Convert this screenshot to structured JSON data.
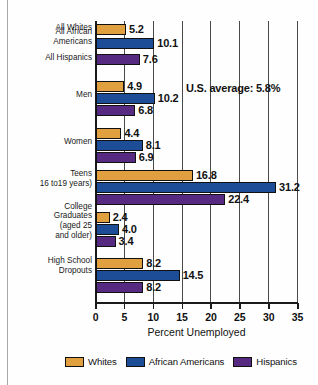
{
  "chart_data": {
    "type": "bar",
    "orientation": "horizontal",
    "title": "",
    "xlabel": "Percent Unemployed",
    "ylabel": "",
    "xlim": [
      0,
      35
    ],
    "xticks": [
      0,
      5,
      10,
      15,
      20,
      25,
      30,
      35
    ],
    "grid": true,
    "legend_position": "bottom",
    "categories": [
      "All Whites",
      "All African\nAmericans",
      "All Hispanics",
      "Men",
      "Women",
      "Teens\n16 to19 years)",
      "College\nGraduates\n(aged 25\nand older)",
      "High School\nDropouts"
    ],
    "series": [
      {
        "name": "Whites",
        "color": "#e0a03f"
      },
      {
        "name": "African Americans",
        "color": "#1c4d96"
      },
      {
        "name": "Hispanics",
        "color": "#552a80"
      }
    ],
    "groups": [
      {
        "label_lines": [
          "All Whites"
        ],
        "label_anchor_y": 27,
        "single": true,
        "bars": [
          {
            "series": "Whites",
            "value": 5.2,
            "label": "5.2",
            "y": 24
          }
        ]
      },
      {
        "label_lines": [
          "All African",
          "Americans"
        ],
        "label_anchor_y": 36,
        "single": true,
        "bars": [
          {
            "series": "African Americans",
            "value": 10.1,
            "label": "10.1",
            "y": 38
          }
        ]
      },
      {
        "label_lines": [
          "All Hispanics"
        ],
        "label_anchor_y": 57,
        "single": true,
        "bars": [
          {
            "series": "Hispanics",
            "value": 7.6,
            "label": "7.6",
            "y": 54
          }
        ]
      },
      {
        "label_lines": [
          "Men"
        ],
        "label_anchor_y": 94,
        "single": false,
        "bars": [
          {
            "series": "Whites",
            "value": 4.9,
            "label": "4.9",
            "y": 81
          },
          {
            "series": "African Americans",
            "value": 10.2,
            "label": "10.2",
            "y": 93
          },
          {
            "series": "Hispanics",
            "value": 6.8,
            "label": "6.8",
            "y": 105
          }
        ]
      },
      {
        "label_lines": [
          "Women"
        ],
        "label_anchor_y": 141,
        "single": false,
        "bars": [
          {
            "series": "Whites",
            "value": 4.4,
            "label": "4.4",
            "y": 128
          },
          {
            "series": "African Americans",
            "value": 8.1,
            "label": "8.1",
            "y": 140
          },
          {
            "series": "Hispanics",
            "value": 6.9,
            "label": "6.9",
            "y": 152
          }
        ]
      },
      {
        "label_lines": [
          "Teens",
          "16 to19 years)"
        ],
        "label_anchor_y": 178,
        "single": false,
        "bars": [
          {
            "series": "Whites",
            "value": 16.8,
            "label": "16.8",
            "y": 170
          },
          {
            "series": "African Americans",
            "value": 31.2,
            "label": "31.2",
            "y": 182
          },
          {
            "series": "Hispanics",
            "value": 22.4,
            "label": "22.4",
            "y": 194
          }
        ]
      },
      {
        "label_lines": [
          "College",
          "Graduates",
          "(aged 25",
          "and older)"
        ],
        "label_anchor_y": 220,
        "single": false,
        "bars": [
          {
            "series": "Whites",
            "value": 2.4,
            "label": "2.4",
            "y": 212
          },
          {
            "series": "African Americans",
            "value": 4.0,
            "label": "4.0",
            "y": 224
          },
          {
            "series": "Hispanics",
            "value": 3.4,
            "label": "3.4",
            "y": 236
          }
        ]
      },
      {
        "label_lines": [
          "High School",
          "Dropouts"
        ],
        "label_anchor_y": 265,
        "single": false,
        "bars": [
          {
            "series": "Whites",
            "value": 8.2,
            "label": "8.2",
            "y": 258
          },
          {
            "series": "African Americans",
            "value": 14.5,
            "label": "14.5",
            "y": 270
          },
          {
            "series": "Hispanics",
            "value": 8.2,
            "label": "8.2",
            "y": 282
          }
        ]
      }
    ],
    "annotations": [
      {
        "text": "U.S. average: 5.8%"
      }
    ]
  },
  "legend": {
    "items": [
      {
        "label": "Whites",
        "key": "w"
      },
      {
        "label": "African Americans",
        "key": "aa"
      },
      {
        "label": "Hispanics",
        "key": "h"
      }
    ]
  },
  "axis": {
    "title": "Percent Unemployed",
    "tick_labels": [
      "0",
      "5",
      "10",
      "15",
      "20",
      "25",
      "30",
      "35"
    ]
  },
  "annotation": {
    "us_average": "U.S. average: 5.8%"
  },
  "colors": {
    "whites": "#e0a03f",
    "african_americans": "#1c4d96",
    "hispanics": "#552a80",
    "axis": "#1a1a1a",
    "grid": "#4a4a4a",
    "background": "#fefefe"
  }
}
